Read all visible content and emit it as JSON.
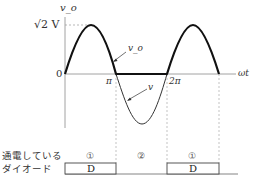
{
  "diagram": {
    "type": "waveform",
    "title": "",
    "axes": {
      "y_label": "v_o",
      "x_label": "ωt",
      "origin_label": "0",
      "peak_label": "√2 V",
      "x_ticks": [
        "π",
        "2π"
      ]
    },
    "curves": [
      {
        "name": "v_o",
        "label": "v_o",
        "description": "half-wave rectified output: positive sine humps on 0–π and 2π–3π, zero on π–2π"
      },
      {
        "name": "v",
        "label": "v",
        "description": "negative half of source sine on π–2π (thin line)"
      }
    ],
    "conduction": {
      "row_label_line1": "通電している",
      "row_label_line2": "ダイオード",
      "segments": [
        {
          "mode": "①",
          "device": "D"
        },
        {
          "mode": "②",
          "device": ""
        },
        {
          "mode": "①",
          "device": "D"
        }
      ]
    },
    "colors": {
      "curve": "#1a1a1a",
      "axis": "#888888",
      "dashed": "#999999",
      "text": "#333333"
    }
  }
}
